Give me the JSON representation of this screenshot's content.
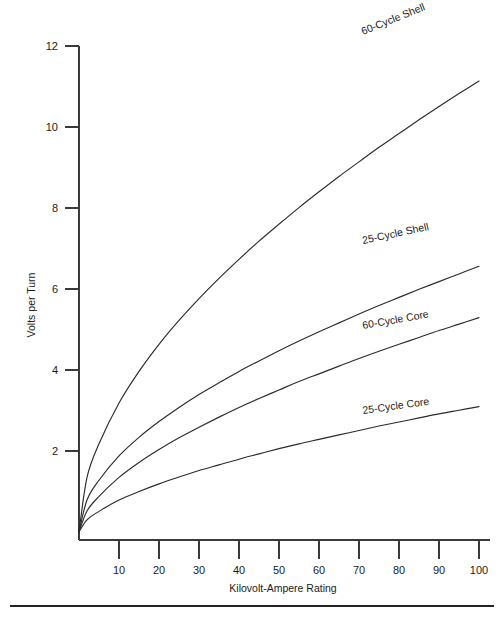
{
  "chart_data": {
    "type": "line",
    "title": "",
    "xlabel": "Kilovolt-Ampere Rating",
    "ylabel": "Volts per Turn",
    "xlim": [
      0,
      104
    ],
    "ylim": [
      0,
      12.6
    ],
    "grid": false,
    "legend_position": "inline-curve-labels",
    "xticks": [
      10,
      20,
      30,
      40,
      50,
      60,
      70,
      80,
      90,
      100
    ],
    "yticks": [
      2,
      4,
      6,
      8,
      10,
      12
    ],
    "x": [
      0,
      2,
      5,
      10,
      15,
      20,
      25,
      30,
      35,
      40,
      45,
      50,
      55,
      60,
      65,
      70,
      75,
      80,
      85,
      90,
      95,
      100
    ],
    "series": [
      {
        "name": "60-Cycle Shell",
        "values": [
          0,
          1.35,
          2.18,
          3.19,
          3.97,
          4.64,
          5.23,
          5.77,
          6.27,
          6.74,
          7.19,
          7.61,
          8.02,
          8.41,
          8.79,
          9.15,
          9.51,
          9.85,
          10.19,
          10.52,
          10.84,
          11.15
        ],
        "label_x": 66,
        "label_y": 11.95,
        "label_rotation": -22
      },
      {
        "name": "25-Cycle Shell",
        "values": [
          0,
          0.79,
          1.28,
          1.88,
          2.34,
          2.73,
          3.08,
          3.4,
          3.69,
          3.97,
          4.23,
          4.48,
          4.72,
          4.95,
          5.17,
          5.39,
          5.6,
          5.8,
          6.0,
          6.19,
          6.38,
          6.57
        ],
        "label_x": 66,
        "label_y": 7.15,
        "label_rotation": -12
      },
      {
        "name": "60-Cycle Core",
        "values": [
          0,
          0.52,
          0.88,
          1.35,
          1.72,
          2.04,
          2.33,
          2.59,
          2.84,
          3.08,
          3.3,
          3.51,
          3.72,
          3.91,
          4.1,
          4.29,
          4.47,
          4.64,
          4.81,
          4.98,
          5.14,
          5.3
        ],
        "label_x": 66,
        "label_y": 5.15,
        "label_rotation": -10
      },
      {
        "name": "25-Cycle Core",
        "values": [
          0,
          0.3,
          0.51,
          0.79,
          1.0,
          1.19,
          1.36,
          1.52,
          1.66,
          1.8,
          1.93,
          2.06,
          2.18,
          2.29,
          2.4,
          2.51,
          2.62,
          2.72,
          2.82,
          2.92,
          3.01,
          3.1
        ],
        "label_x": 66,
        "label_y": 2.95,
        "label_rotation": -8
      }
    ]
  },
  "axes": {
    "y_title": "Volts per Turn",
    "x_title": "Kilovolt-Ampere Rating",
    "y_tick_labels": [
      "12",
      "10",
      "8",
      "6",
      "4",
      "2"
    ],
    "x_tick_labels": [
      "10",
      "20",
      "30",
      "40",
      "50",
      "60",
      "70",
      "80",
      "90",
      "100"
    ]
  },
  "series_labels": {
    "s0": "60-Cycle Shell",
    "s1": "25-Cycle Shell",
    "s2": "60-Cycle Core",
    "s3": "25-Cycle Core"
  },
  "footer": {
    "caption": ""
  },
  "colors": {
    "curve": "#2b2b2b",
    "axis": "#3a3a3a",
    "text": "#1a1a1a",
    "background": "#ffffff",
    "rule": "#222222"
  }
}
